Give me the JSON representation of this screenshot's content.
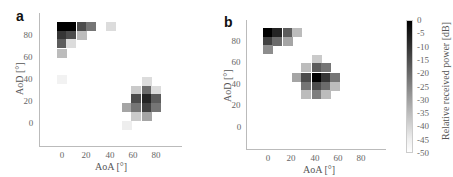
{
  "chart_data": [
    {
      "type": "heatmap",
      "panel": "a",
      "title": "",
      "xlabel": "AoA [°]",
      "ylabel": "AoD [°]",
      "xticks": [
        "0",
        "20",
        "40",
        "60",
        "80"
      ],
      "yticks": [
        "0",
        "20",
        "40",
        "60",
        "80"
      ],
      "xlim": [
        -20,
        95
      ],
      "ylim": [
        -20,
        95
      ],
      "colorbar": "Relative received power [dB]",
      "clusters": [
        {
          "center_aoa": 5,
          "center_aod": 88,
          "peak_db": 0
        },
        {
          "center_aoa": 72,
          "center_aod": 20,
          "peak_db": -8
        }
      ],
      "cells": [
        {
          "aoa": 0,
          "aod": 88,
          "db": 0
        },
        {
          "aoa": 8,
          "aod": 88,
          "db": 0
        },
        {
          "aoa": 17,
          "aod": 88,
          "db": -12
        },
        {
          "aoa": 25,
          "aod": 88,
          "db": -20
        },
        {
          "aoa": 42,
          "aod": 88,
          "db": -42
        },
        {
          "aoa": 0,
          "aod": 80,
          "db": -8
        },
        {
          "aoa": 8,
          "aod": 80,
          "db": -12
        },
        {
          "aoa": 17,
          "aod": 80,
          "db": -35
        },
        {
          "aoa": 0,
          "aod": 72,
          "db": -15
        },
        {
          "aoa": 8,
          "aod": 72,
          "db": -42
        },
        {
          "aoa": 0,
          "aod": 63,
          "db": -35
        },
        {
          "aoa": 0,
          "aod": 40,
          "db": -47
        },
        {
          "aoa": 72,
          "aod": 38,
          "db": -42
        },
        {
          "aoa": 63,
          "aod": 30,
          "db": -38
        },
        {
          "aoa": 72,
          "aod": 30,
          "db": -18
        },
        {
          "aoa": 80,
          "aod": 30,
          "db": -42
        },
        {
          "aoa": 63,
          "aod": 22,
          "db": -12
        },
        {
          "aoa": 72,
          "aod": 22,
          "db": -5
        },
        {
          "aoa": 80,
          "aod": 22,
          "db": -15
        },
        {
          "aoa": 55,
          "aod": 14,
          "db": -30
        },
        {
          "aoa": 63,
          "aod": 14,
          "db": -20
        },
        {
          "aoa": 72,
          "aod": 14,
          "db": -10
        },
        {
          "aoa": 80,
          "aod": 14,
          "db": -20
        },
        {
          "aoa": 63,
          "aod": 6,
          "db": -38
        },
        {
          "aoa": 72,
          "aod": 6,
          "db": -30
        },
        {
          "aoa": 55,
          "aod": -2,
          "db": -46
        }
      ]
    },
    {
      "type": "heatmap",
      "panel": "b",
      "title": "",
      "xlabel": "AoA [°]",
      "ylabel": "AoD [°]",
      "xticks": [
        "0",
        "20",
        "40",
        "60",
        "80"
      ],
      "yticks": [
        "0",
        "20",
        "40",
        "60",
        "80"
      ],
      "xlim": [
        -20,
        95
      ],
      "ylim": [
        -20,
        95
      ],
      "colorbar": "Relative received power [dB]",
      "clusters": [
        {
          "center_aoa": 5,
          "center_aod": 88,
          "peak_db": 0
        },
        {
          "center_aoa": 42,
          "center_aod": 45,
          "peak_db": 0
        }
      ],
      "cells": [
        {
          "aoa": 0,
          "aod": 88,
          "db": 0
        },
        {
          "aoa": 8,
          "aod": 88,
          "db": -5
        },
        {
          "aoa": 17,
          "aod": 88,
          "db": -15
        },
        {
          "aoa": 25,
          "aod": 88,
          "db": -35
        },
        {
          "aoa": 0,
          "aod": 80,
          "db": -10
        },
        {
          "aoa": 8,
          "aod": 80,
          "db": -18
        },
        {
          "aoa": 17,
          "aod": 80,
          "db": -30
        },
        {
          "aoa": 0,
          "aod": 72,
          "db": -25
        },
        {
          "aoa": 42,
          "aod": 63,
          "db": -38
        },
        {
          "aoa": 33,
          "aod": 55,
          "db": -35
        },
        {
          "aoa": 42,
          "aod": 55,
          "db": -15
        },
        {
          "aoa": 50,
          "aod": 55,
          "db": -20
        },
        {
          "aoa": 25,
          "aod": 46,
          "db": -30
        },
        {
          "aoa": 33,
          "aod": 46,
          "db": -12
        },
        {
          "aoa": 42,
          "aod": 46,
          "db": 0
        },
        {
          "aoa": 50,
          "aod": 46,
          "db": -8
        },
        {
          "aoa": 58,
          "aod": 46,
          "db": -20
        },
        {
          "aoa": 33,
          "aod": 38,
          "db": -20
        },
        {
          "aoa": 42,
          "aod": 38,
          "db": -12
        },
        {
          "aoa": 50,
          "aod": 38,
          "db": -18
        },
        {
          "aoa": 58,
          "aod": 38,
          "db": -35
        },
        {
          "aoa": 33,
          "aod": 30,
          "db": -35
        },
        {
          "aoa": 42,
          "aod": 30,
          "db": -22
        },
        {
          "aoa": 50,
          "aod": 30,
          "db": -35
        }
      ]
    }
  ],
  "panels": {
    "a": {
      "label": "a",
      "xlabel": "AoA [°]",
      "ylabel": "AoD [°]"
    },
    "b": {
      "label": "b",
      "xlabel": "AoA [°]",
      "ylabel": "AoD [°]"
    }
  },
  "ticks": {
    "t0": "0",
    "t20": "20",
    "t40": "40",
    "t60": "60",
    "t80": "80"
  },
  "colorbar": {
    "title": "Relative received power [dB]",
    "labels": [
      "0",
      "-5",
      "-10",
      "-15",
      "-20",
      "-25",
      "-30",
      "-35",
      "-40",
      "-45",
      "-50"
    ]
  }
}
